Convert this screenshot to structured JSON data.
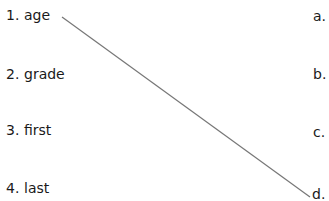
{
  "left_items": [
    {
      "num": "1.",
      "word": "age"
    },
    {
      "num": "2.",
      "word": "grade"
    },
    {
      "num": "3.",
      "word": "first"
    },
    {
      "num": "4.",
      "word": "last"
    }
  ],
  "right_items": [
    "a.",
    "b.",
    "c.",
    "d."
  ],
  "connections": [
    {
      "from": "1",
      "to": "d",
      "color": "#777777"
    }
  ]
}
